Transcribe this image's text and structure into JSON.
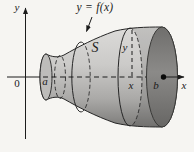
{
  "figure": {
    "type": "solid-of-revolution-diagram",
    "labels": {
      "y_axis": "y",
      "x_axis": "x",
      "origin": "0",
      "left_bound": "a",
      "right_bound": "b",
      "curve": "y = f(x)",
      "solid_name": "S",
      "radius_label": "y",
      "section_x_label": "x"
    },
    "colors": {
      "background": "#f6f5f2",
      "body_top": "#dcdbd9",
      "body_mid": "#c6c5c3",
      "body_bottom": "#7c7b79",
      "end_cap": "#868583",
      "line": "#1c1c1c"
    }
  }
}
